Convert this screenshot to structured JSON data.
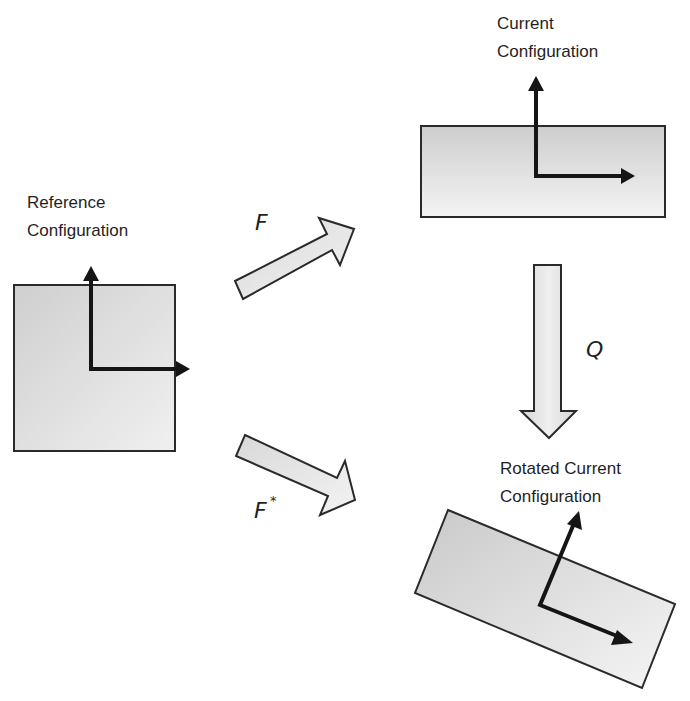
{
  "diagram": {
    "type": "continuum-mechanics-configuration-mapping",
    "colors": {
      "background": "#ffffff",
      "shape_fill_light": "#f2f2f2",
      "shape_fill_dark": "#cfcfcf",
      "outline": "#2a2a2a",
      "axis_arrows": "#151515",
      "text": "#1f1f1f"
    },
    "configurations": {
      "reference": {
        "label_line1": "Reference",
        "label_line2": "Configuration",
        "shape": "square"
      },
      "current": {
        "label_line1": "Current",
        "label_line2": "Configuration",
        "shape": "rectangle"
      },
      "rotated_current": {
        "label_line1": "Rotated Current",
        "label_line2": "Configuration",
        "shape": "rotated-rectangle"
      }
    },
    "mappings": {
      "F": {
        "symbol": "F",
        "superscript": "",
        "from": "Reference Configuration",
        "to": "Current Configuration"
      },
      "F_star": {
        "symbol": "F",
        "superscript": "*",
        "from": "Reference Configuration",
        "to": "Rotated Current Configuration"
      },
      "Q": {
        "symbol": "Q",
        "superscript": "",
        "from": "Current Configuration",
        "to": "Rotated Current Configuration"
      }
    }
  }
}
